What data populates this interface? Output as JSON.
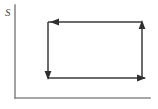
{
  "figure": {
    "width": 158,
    "height": 109,
    "background_color": "#ffffff"
  },
  "axes": {
    "vertical": {
      "label": "S",
      "label_x": 5,
      "label_y": 13,
      "x": 15,
      "y_top": 5,
      "y_bottom": 98,
      "color": "#8a8a8a",
      "stroke_width": 1.6,
      "has_arrowhead": false
    },
    "horizontal": {
      "label": "",
      "y": 98,
      "x_left": 15,
      "x_right": 150,
      "color": "#8a8a8a",
      "stroke_width": 1.6,
      "has_arrowhead": false
    }
  },
  "cycle": {
    "direction": "counterclockwise",
    "color": "#3a3a3a",
    "stroke_width": 1.5,
    "arrow_color": "#2f2f2f",
    "corners": {
      "top_left": {
        "x": 48,
        "y": 22
      },
      "top_right": {
        "x": 142,
        "y": 22
      },
      "bottom_right": {
        "x": 142,
        "y": 78
      },
      "bottom_left": {
        "x": 48,
        "y": 78
      }
    },
    "edges": [
      {
        "name": "top-edge",
        "from": {
          "x": 142,
          "y": 22
        },
        "to": {
          "x": 48,
          "y": 22
        },
        "arrow_direction": "left",
        "arrow_at": {
          "x": 50,
          "y": 22
        }
      },
      {
        "name": "left-edge",
        "from": {
          "x": 48,
          "y": 22
        },
        "to": {
          "x": 48,
          "y": 78
        },
        "arrow_direction": "down",
        "arrow_at": {
          "x": 48,
          "y": 80
        }
      },
      {
        "name": "bottom-edge",
        "from": {
          "x": 48,
          "y": 78
        },
        "to": {
          "x": 145,
          "y": 78
        },
        "arrow_direction": "right",
        "arrow_at": {
          "x": 146,
          "y": 78
        }
      },
      {
        "name": "right-edge",
        "from": {
          "x": 142,
          "y": 78
        },
        "to": {
          "x": 142,
          "y": 22
        },
        "arrow_direction": "up",
        "arrow_at": {
          "x": 142,
          "y": 20
        }
      }
    ]
  }
}
